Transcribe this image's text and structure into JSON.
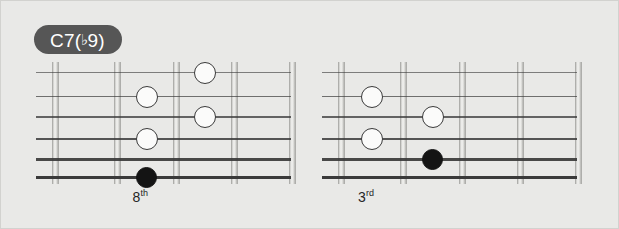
{
  "panel": {
    "background_color": "#e9e9e7",
    "border_color": "#d2d2cf"
  },
  "chord": {
    "name_prefix": "C7(",
    "flat_symbol": "♭",
    "name_suffix": "9)",
    "full_name": "C7(♭9)",
    "badge_color": "#565656",
    "text_color": "#ffffff"
  },
  "chart_data": {
    "type": "diagram",
    "title": "C7(♭9)",
    "instrument": "guitar",
    "string_count": 6,
    "fret_count": 5,
    "diagrams": [
      {
        "id": "voicing-8th",
        "position_label_text": "8",
        "position_label_suffix": "th",
        "position_label": "8th",
        "notes": [
          {
            "string": 2,
            "fret": 2,
            "type": "open"
          },
          {
            "string": 4,
            "fret": 2,
            "type": "open"
          },
          {
            "string": 6,
            "fret": 2,
            "type": "filled"
          },
          {
            "string": 1,
            "fret": 3,
            "type": "open"
          },
          {
            "string": 3,
            "fret": 3,
            "type": "open"
          }
        ]
      },
      {
        "id": "voicing-3rd",
        "position_label_text": "3",
        "position_label_suffix": "rd",
        "position_label": "3rd",
        "notes": [
          {
            "string": 2,
            "fret": 1,
            "type": "open"
          },
          {
            "string": 4,
            "fret": 1,
            "type": "open"
          },
          {
            "string": 3,
            "fret": 2,
            "type": "open"
          },
          {
            "string": 5,
            "fret": 2,
            "type": "filled"
          }
        ]
      }
    ]
  },
  "geometry": {
    "diagram_left": [
      35,
      321
    ],
    "board_width": 255,
    "fret_x": [
      16,
      78,
      137,
      195,
      253
    ],
    "fret_top": 3,
    "fret_height": 122,
    "string_y": [
      10,
      34,
      54,
      76,
      96,
      114
    ],
    "string_thickness": [
      1.2,
      1.4,
      1.8,
      2.1,
      2.5,
      3.0
    ],
    "note_radius": 11,
    "label_y": 126
  }
}
